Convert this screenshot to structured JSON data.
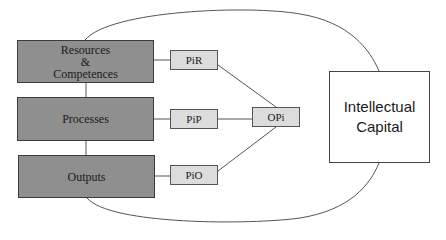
{
  "diagram": {
    "main_boxes": [
      {
        "id": "resources",
        "label": "Resources\n&\nCompetences"
      },
      {
        "id": "processes",
        "label": "Processes"
      },
      {
        "id": "outputs",
        "label": "Outputs"
      }
    ],
    "indicator_boxes": [
      {
        "id": "pir",
        "label": "PiR"
      },
      {
        "id": "pip",
        "label": "PiP"
      },
      {
        "id": "pio",
        "label": "PiO"
      }
    ],
    "aggregate_box": {
      "id": "opi",
      "label": "OPi"
    },
    "target_box": {
      "id": "intellectual-capital",
      "label": "Intellectual\nCapital"
    },
    "edges": [
      [
        "resources",
        "pir"
      ],
      [
        "processes",
        "pip"
      ],
      [
        "outputs",
        "pio"
      ],
      [
        "resources",
        "processes"
      ],
      [
        "processes",
        "outputs"
      ],
      [
        "pir",
        "opi"
      ],
      [
        "pip",
        "opi"
      ],
      [
        "pio",
        "opi"
      ],
      [
        "resources",
        "intellectual-capital"
      ],
      [
        "outputs",
        "intellectual-capital"
      ]
    ],
    "colors": {
      "main_fill": "#8f8f8f",
      "small_fill": "#dcdcdc",
      "target_fill": "#ffffff",
      "line": "#555555"
    }
  }
}
